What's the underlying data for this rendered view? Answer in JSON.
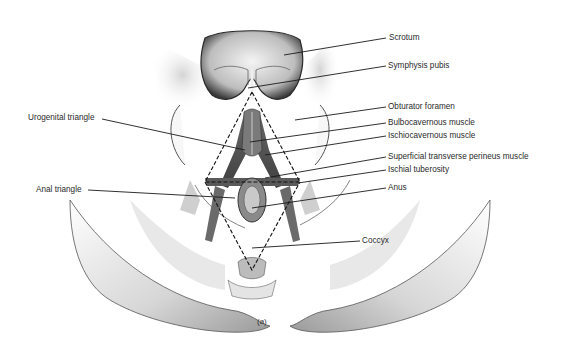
{
  "figure": {
    "caption": "(a)",
    "labels_right": [
      {
        "id": "scrotum",
        "text": "Scrotum"
      },
      {
        "id": "symphysis-pubis",
        "text": "Symphysis pubis"
      },
      {
        "id": "obturator-foramen",
        "text": "Obturator foramen"
      },
      {
        "id": "bulbocavernous-muscle",
        "text": "Bulbocavernous muscle"
      },
      {
        "id": "ischiocavernous-muscle",
        "text": "Ischiocavernous muscle"
      },
      {
        "id": "superficial-transverse-perineus-muscle",
        "text": "Superficial transverse perineus muscle"
      },
      {
        "id": "ischial-tuberosity",
        "text": "Ischial tuberosity"
      },
      {
        "id": "anus",
        "text": "Anus"
      },
      {
        "id": "coccyx",
        "text": "Coccyx"
      }
    ],
    "labels_left": [
      {
        "id": "urogenital-triangle",
        "text": "Urogenital triangle"
      },
      {
        "id": "anal-triangle",
        "text": "Anal triangle"
      }
    ]
  }
}
